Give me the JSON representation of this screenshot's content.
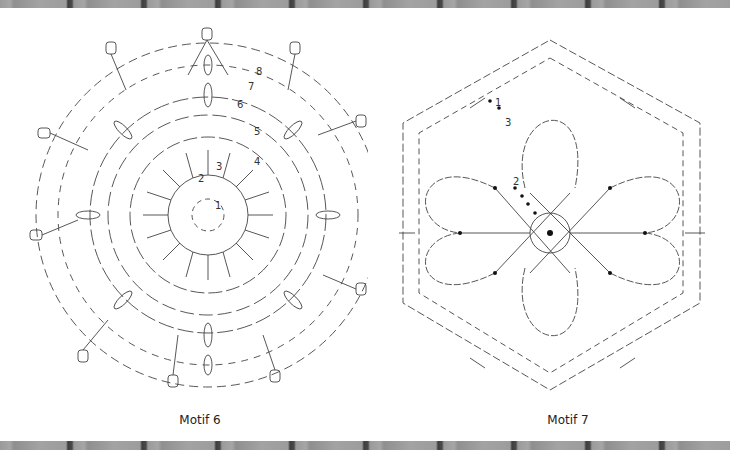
{
  "motifs": [
    {
      "caption": "Motif 6",
      "round_labels": [
        "1",
        "2",
        "3",
        "4",
        "5",
        "6",
        "7",
        "8"
      ],
      "shape": "octagonal flower (8-fold)"
    },
    {
      "caption": "Motif 7",
      "round_labels": [
        "1",
        "2",
        "3"
      ],
      "shape": "hexagonal flower (6 petals)"
    }
  ],
  "colors": {
    "stroke": "#444444",
    "background": "#ffffff",
    "border": "#9a9a9a"
  }
}
